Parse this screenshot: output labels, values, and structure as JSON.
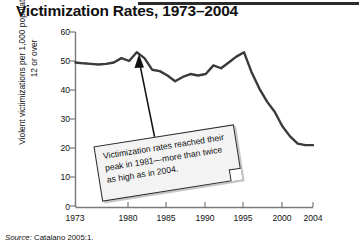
{
  "figure": {
    "title": "Victimization Rates, 1973–2004",
    "source_prefix": "Source:",
    "source_text": "Catalano 2005:1."
  },
  "annotation": {
    "text": "Victimization rates reached their peak in 1981—more than twice as high as in 2004.",
    "points_to_year": 1981,
    "points_to_value": 53
  },
  "chart_data": {
    "type": "line",
    "title": "Victimization Rates, 1973–2004",
    "xlabel": "",
    "ylabel": "Violent victimizations per 1,000 population age 12 or over",
    "xlim": [
      1973,
      2004
    ],
    "ylim": [
      0,
      60
    ],
    "grid": false,
    "legend": null,
    "xticks": [
      1973,
      1980,
      1985,
      1990,
      1995,
      2000,
      2004
    ],
    "xtick_labels": [
      "1973",
      "1980",
      "1985",
      "1990",
      "1995",
      "2000",
      "2004"
    ],
    "yticks": [
      0,
      10,
      20,
      30,
      40,
      50,
      60
    ],
    "ytick_labels": [
      "0",
      "10",
      "20",
      "30",
      "40",
      "50",
      "60"
    ],
    "line_color": "#3a3a3a",
    "x": [
      1973,
      1974,
      1975,
      1976,
      1977,
      1978,
      1979,
      1980,
      1981,
      1982,
      1983,
      1984,
      1985,
      1986,
      1987,
      1988,
      1989,
      1990,
      1991,
      1992,
      1993,
      1994,
      1995,
      1996,
      1997,
      1998,
      1999,
      2000,
      2001,
      2002,
      2003,
      2004
    ],
    "values": [
      49.5,
      49.2,
      49.0,
      48.8,
      49.0,
      49.5,
      51.0,
      50.0,
      53.0,
      51.0,
      47.0,
      46.5,
      45.0,
      43.0,
      44.5,
      45.5,
      45.0,
      45.5,
      48.5,
      47.5,
      49.5,
      51.5,
      53.0,
      46.0,
      40.5,
      36.0,
      32.5,
      27.5,
      24.0,
      21.5,
      21.0,
      21.0
    ]
  }
}
